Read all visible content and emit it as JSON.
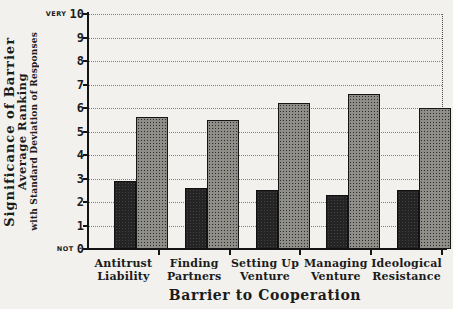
{
  "page": {
    "background_color": "#f2f1ed",
    "ink_color": "#1b1b1b"
  },
  "y_axis": {
    "title_lines": {
      "main": "Significance of Barrier",
      "sub": "Average Ranking",
      "small": "with Standard Deviation of Responses"
    },
    "tick_labels": [
      "0",
      "1",
      "2",
      "3",
      "4",
      "5",
      "6",
      "7",
      "8",
      "9",
      "10"
    ],
    "top_qualifier": "VERY",
    "bottom_qualifier": "NOT",
    "min": 0,
    "max": 10
  },
  "x_axis": {
    "title": "Barrier to Cooperation"
  },
  "chart_data": {
    "type": "bar",
    "title": "",
    "categories": [
      "Antitrust Liability",
      "Finding Partners",
      "Setting Up Venture",
      "Managing Venture",
      "Ideological Resistance"
    ],
    "category_label_lines": [
      [
        "Antitrust",
        "Liability"
      ],
      [
        "Finding",
        "Partners"
      ],
      [
        "Setting Up",
        "Venture"
      ],
      [
        "Managing",
        "Venture"
      ],
      [
        "Ideological",
        "Resistance"
      ]
    ],
    "series": [
      {
        "name": "dark solid bar (left)",
        "style": "dark-solid",
        "values": [
          2.9,
          2.6,
          2.5,
          2.3,
          2.5
        ]
      },
      {
        "name": "halftone dotted bar (right)",
        "style": "halftone-dots",
        "values": [
          5.6,
          5.5,
          6.2,
          6.6,
          6.0
        ]
      }
    ],
    "xlabel": "Barrier to Cooperation",
    "ylabel": "Significance of Barrier — Average Ranking with Standard Deviation of Responses",
    "ylim": [
      0,
      10
    ],
    "grid": "horizontal-dotted-every-1",
    "legend": "none",
    "colors": {
      "dark_bar": "#242424",
      "halftone_bar_base": "#d6d4cc",
      "halftone_dot": "#2f2f2d",
      "gridline": "#83807a",
      "axis": "#141414"
    }
  }
}
